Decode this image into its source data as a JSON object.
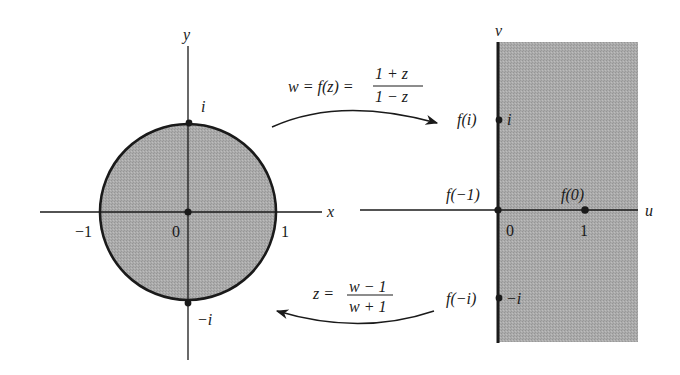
{
  "colors": {
    "shade": "#a9a9a9",
    "ink": "#1a1a1a",
    "background": "#ffffff"
  },
  "z_plane": {
    "x_axis_label": "x",
    "y_axis_label": "y",
    "origin_label": "0",
    "tick_neg1": "−1",
    "tick_1": "1",
    "point_i_label": "i",
    "point_neg_i_label": "−i",
    "region": "unit disk |z| < 1 (shaded)"
  },
  "w_plane": {
    "u_axis_label": "u",
    "v_axis_label": "v",
    "origin_label": "0",
    "tick_1": "1",
    "f_i_label": "f(i)",
    "i_label": "i",
    "f_neg1_label": "f(−1)",
    "f_0_label": "f(0)",
    "f_neg_i_label": "f(−i)",
    "neg_i_label": "−i",
    "region": "right half-plane Re(w) > 0 (shaded)"
  },
  "mappings": {
    "forward": {
      "lhs": "w = f(z) =",
      "numerator": "1 + z",
      "denominator": "1 − z"
    },
    "inverse": {
      "lhs": "z =",
      "numerator": "w − 1",
      "denominator": "w + 1"
    }
  }
}
